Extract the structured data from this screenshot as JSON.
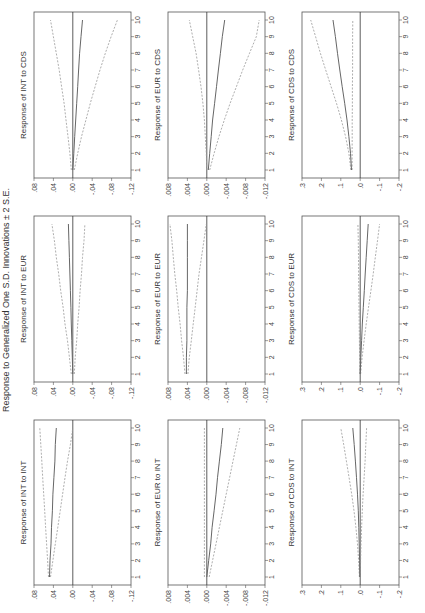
{
  "title": "Response to Generalized One S.D. Innovations ± 2 S.E.",
  "chart_data": {
    "type": "line",
    "title": "Response to Generalized One S.D. Innovations ± 2 S.E.",
    "orientation": "rotated 90deg counter-clockwise",
    "x": [
      1,
      2,
      3,
      4,
      5,
      6,
      7,
      8,
      9,
      10
    ],
    "xlabel": "",
    "ylabel": "",
    "series_style": {
      "response": "solid",
      "bands": "dashed (±2 S.E.)"
    },
    "panels": [
      {
        "title": "Response of INT to CDS",
        "row": 0,
        "col": 0,
        "ylim": [
          -0.12,
          0.08
        ],
        "yticks": [
          ".08",
          ".04",
          ".00",
          "-.04",
          "-.08",
          "-.12"
        ],
        "ytick_values": [
          0.08,
          0.04,
          0,
          -0.04,
          -0.08,
          -0.12
        ],
        "response": [
          0.0,
          -0.002,
          -0.004,
          -0.006,
          -0.008,
          -0.01,
          -0.012,
          -0.014,
          -0.017,
          -0.02
        ],
        "upper": [
          0.003,
          0.006,
          0.01,
          0.014,
          0.018,
          0.023,
          0.028,
          0.034,
          0.04,
          0.046
        ],
        "lower": [
          -0.003,
          -0.01,
          -0.018,
          -0.027,
          -0.036,
          -0.046,
          -0.056,
          -0.067,
          -0.079,
          -0.092
        ]
      },
      {
        "title": "Response of EUR to CDS",
        "row": 0,
        "col": 1,
        "ylim": [
          -0.012,
          0.008
        ],
        "yticks": [
          ".008",
          ".004",
          ".000",
          "-.004",
          "-.008",
          "-.012"
        ],
        "ytick_values": [
          0.008,
          0.004,
          0,
          -0.004,
          -0.008,
          -0.012
        ],
        "response": [
          -0.0003,
          -0.0006,
          -0.0009,
          -0.0012,
          -0.0016,
          -0.002,
          -0.0024,
          -0.0028,
          -0.0032,
          -0.0037
        ],
        "upper": [
          0.0,
          0.0001,
          0.0003,
          0.0005,
          0.0008,
          0.0012,
          0.0017,
          0.0022,
          0.0029,
          0.0036
        ],
        "lower": [
          -0.0006,
          -0.0015,
          -0.0025,
          -0.0036,
          -0.0048,
          -0.0061,
          -0.0074,
          -0.0088,
          -0.0102,
          -0.0108
        ]
      },
      {
        "title": "Response of CDS to CDS",
        "row": 0,
        "col": 2,
        "ylim": [
          -0.2,
          0.3
        ],
        "yticks": [
          ".3",
          ".2",
          ".1",
          ".0",
          "-.1",
          "-.2"
        ],
        "ytick_values": [
          0.3,
          0.2,
          0.1,
          0,
          -0.1,
          -0.2
        ],
        "response": [
          0.045,
          0.05,
          0.058,
          0.068,
          0.08,
          0.093,
          0.105,
          0.117,
          0.128,
          0.14
        ],
        "upper": [
          0.048,
          0.058,
          0.075,
          0.097,
          0.122,
          0.15,
          0.178,
          0.205,
          0.23,
          0.255
        ],
        "lower": [
          0.042,
          0.042,
          0.041,
          0.041,
          0.04,
          0.04,
          0.039,
          0.039,
          0.039,
          0.038
        ]
      },
      {
        "title": "Response of INT to EUR",
        "row": 1,
        "col": 0,
        "ylim": [
          -0.12,
          0.08
        ],
        "yticks": [
          ".08",
          ".04",
          ".00",
          "-.04",
          "-.08",
          "-.12"
        ],
        "ytick_values": [
          0.08,
          0.04,
          0,
          -0.04,
          -0.08,
          -0.12
        ],
        "response": [
          0.0,
          0.001,
          0.002,
          0.003,
          0.004,
          0.005,
          0.006,
          0.007,
          0.008,
          0.009
        ],
        "upper": [
          0.003,
          0.007,
          0.011,
          0.016,
          0.02,
          0.025,
          0.029,
          0.034,
          0.038,
          0.043
        ],
        "lower": [
          -0.003,
          -0.005,
          -0.008,
          -0.01,
          -0.013,
          -0.015,
          -0.018,
          -0.02,
          -0.023,
          -0.025
        ]
      },
      {
        "title": "Response of EUR to EUR",
        "row": 1,
        "col": 1,
        "ylim": [
          -0.012,
          0.008
        ],
        "yticks": [
          ".008",
          ".004",
          ".000",
          "-.004",
          "-.008",
          "-.012"
        ],
        "ytick_values": [
          0.008,
          0.004,
          0,
          -0.004,
          -0.008,
          -0.012
        ],
        "response": [
          0.0042,
          0.0042,
          0.0041,
          0.0041,
          0.0041,
          0.004,
          0.004,
          0.004,
          0.004,
          0.004
        ],
        "upper": [
          0.0045,
          0.0048,
          0.0052,
          0.0055,
          0.0059,
          0.0062,
          0.0066,
          0.0069,
          0.0072,
          0.0076
        ],
        "lower": [
          0.0039,
          0.0036,
          0.0032,
          0.0028,
          0.0024,
          0.002,
          0.0016,
          0.0011,
          0.0006,
          0.0001
        ]
      },
      {
        "title": "Response of CDS to EUR",
        "row": 1,
        "col": 2,
        "ylim": [
          -0.2,
          0.3
        ],
        "yticks": [
          ".3",
          ".2",
          ".1",
          ".0",
          "-.1",
          "-.2"
        ],
        "ytick_values": [
          0.3,
          0.2,
          0.1,
          0,
          -0.1,
          -0.2
        ],
        "response": [
          0.0,
          -0.003,
          -0.007,
          -0.011,
          -0.016,
          -0.021,
          -0.026,
          -0.031,
          -0.036,
          -0.041
        ],
        "upper": [
          0.002,
          0.003,
          0.004,
          0.005,
          0.006,
          0.007,
          0.008,
          0.009,
          0.01,
          0.012
        ],
        "lower": [
          -0.002,
          -0.01,
          -0.02,
          -0.031,
          -0.043,
          -0.055,
          -0.067,
          -0.078,
          -0.089,
          -0.1
        ]
      },
      {
        "title": "Response of INT to INT",
        "row": 2,
        "col": 0,
        "ylim": [
          -0.12,
          0.08
        ],
        "yticks": [
          ".08",
          ".04",
          ".00",
          "-.04",
          "-.08",
          "-.12"
        ],
        "ytick_values": [
          0.08,
          0.04,
          0,
          -0.04,
          -0.08,
          -0.12
        ],
        "response": [
          0.048,
          0.047,
          0.045,
          0.044,
          0.042,
          0.041,
          0.039,
          0.037,
          0.036,
          0.034
        ],
        "upper": [
          0.05,
          0.052,
          0.054,
          0.056,
          0.058,
          0.06,
          0.062,
          0.064,
          0.066,
          0.068
        ],
        "lower": [
          0.046,
          0.041,
          0.036,
          0.031,
          0.026,
          0.021,
          0.016,
          0.011,
          0.005,
          0.0
        ]
      },
      {
        "title": "Response of EUR to INT",
        "row": 2,
        "col": 1,
        "ylim": [
          -0.012,
          0.008
        ],
        "yticks": [
          ".008",
          ".004",
          ".000",
          "-.004",
          "-.008",
          "-.012"
        ],
        "ytick_values": [
          0.008,
          0.004,
          0,
          -0.004,
          -0.008,
          -0.012
        ],
        "response": [
          0.0,
          -0.0004,
          -0.0008,
          -0.0011,
          -0.0015,
          -0.0019,
          -0.0022,
          -0.0026,
          -0.003,
          -0.0033
        ],
        "upper": [
          0.0005,
          0.0005,
          0.0005,
          0.0005,
          0.0005,
          0.0005,
          0.0005,
          0.0005,
          0.0005,
          0.0005
        ],
        "lower": [
          -0.0005,
          -0.0012,
          -0.0019,
          -0.0026,
          -0.0033,
          -0.004,
          -0.0047,
          -0.0054,
          -0.0061,
          -0.0068
        ]
      },
      {
        "title": "Response of CDS to INT",
        "row": 2,
        "col": 2,
        "ylim": [
          -0.2,
          0.3
        ],
        "yticks": [
          ".3",
          ".2",
          ".1",
          ".0",
          "-.1",
          "-.2"
        ],
        "ytick_values": [
          0.3,
          0.2,
          0.1,
          0,
          -0.1,
          -0.2
        ],
        "response": [
          0.002,
          0.003,
          0.005,
          0.007,
          0.01,
          0.014,
          0.019,
          0.025,
          0.031,
          0.038
        ],
        "upper": [
          0.004,
          0.008,
          0.014,
          0.022,
          0.032,
          0.044,
          0.057,
          0.071,
          0.085,
          0.1
        ],
        "lower": [
          0.0,
          -0.002,
          -0.004,
          -0.007,
          -0.011,
          -0.015,
          -0.02,
          -0.025,
          -0.029,
          -0.033
        ]
      }
    ]
  }
}
